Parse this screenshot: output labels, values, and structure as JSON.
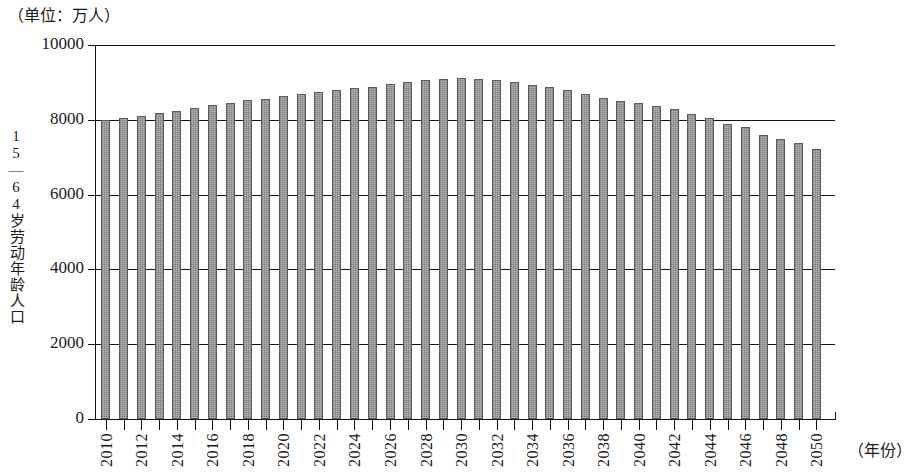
{
  "unit_caption": "（单位：万人）",
  "y_axis_title": "15—64岁劳动年龄人口",
  "x_axis_title": "（年份）",
  "colors": {
    "bar_fill": "#8e8e8e",
    "bar_stroke": "#5a5a5a",
    "axis": "#111111",
    "background": "#ffffff"
  },
  "chart_data": {
    "type": "bar",
    "title": "",
    "subtitle": "",
    "xlabel": "（年份）",
    "ylabel": "15—64岁劳动年龄人口",
    "unit": "万人",
    "ylim": [
      0,
      10000
    ],
    "yticks": [
      0,
      2000,
      4000,
      6000,
      8000,
      10000
    ],
    "ytick_labels": [
      "0",
      "2000",
      "4000",
      "6000",
      "8000",
      "10000"
    ],
    "grid": true,
    "legend": null,
    "xtick_labels": [
      "2010",
      "2012",
      "2014",
      "2016",
      "2018",
      "2020",
      "2022",
      "2024",
      "2026",
      "2028",
      "2030",
      "2032",
      "2034",
      "2036",
      "2038",
      "2040",
      "2042",
      "2044",
      "2046",
      "2048",
      "2050"
    ],
    "categories": [
      "2010",
      "2011",
      "2012",
      "2013",
      "2014",
      "2015",
      "2016",
      "2017",
      "2018",
      "2019",
      "2020",
      "2021",
      "2022",
      "2023",
      "2024",
      "2025",
      "2026",
      "2027",
      "2028",
      "2029",
      "2030",
      "2031",
      "2032",
      "2033",
      "2034",
      "2035",
      "2036",
      "2037",
      "2038",
      "2039",
      "2040",
      "2041",
      "2042",
      "2043",
      "2044",
      "2045",
      "2046",
      "2047",
      "2048",
      "2049",
      "2050"
    ],
    "values": [
      7990,
      8050,
      8110,
      8180,
      8230,
      8320,
      8400,
      8450,
      8520,
      8560,
      8630,
      8700,
      8740,
      8790,
      8850,
      8880,
      8960,
      9010,
      9070,
      9080,
      9110,
      9100,
      9060,
      9010,
      8940,
      8880,
      8790,
      8700,
      8590,
      8490,
      8440,
      8360,
      8290,
      8160,
      8050,
      7890,
      7800,
      7600,
      7500,
      7380,
      7210
    ]
  }
}
